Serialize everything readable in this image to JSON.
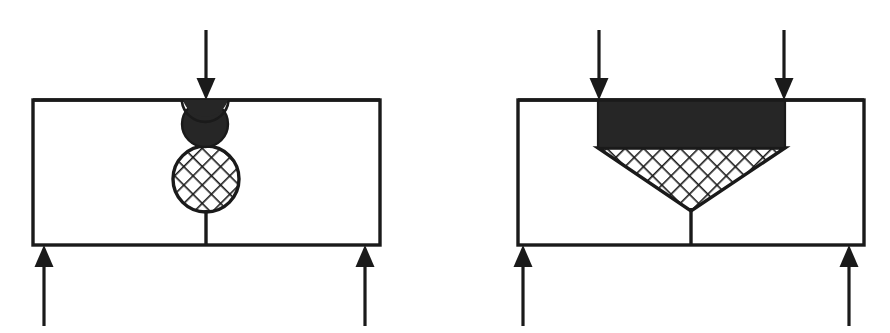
{
  "figure": {
    "background_color": "#ffffff",
    "stroke_color": "#1a1a1a",
    "fill_dark": "#262626",
    "fill_hatch_background": "#ffffff",
    "width": 890,
    "height": 333,
    "panels": [
      {
        "id": "left-panel",
        "name": "single-point-load-panel",
        "description": "Rectangular body with a single concentrated downward load, a solid dark circular contact zone and a cross-hatched circular plastic zone below it, supported by two upward reactions.",
        "body": {
          "name": "specimen-body",
          "shape": "rectangle",
          "x": 33,
          "y": 100,
          "width": 347,
          "height": 145,
          "stroke_width": 3,
          "fill": "#ffffff"
        },
        "load_arrows": [
          {
            "name": "applied-load-arrow",
            "direction": "down",
            "x": 206,
            "tail_y": 30,
            "tip_y": 100
          }
        ],
        "support_arrows": [
          {
            "name": "left-support-reaction-arrow",
            "direction": "up",
            "x": 44,
            "tail_y": 326,
            "tip_y": 245
          },
          {
            "name": "right-support-reaction-arrow",
            "direction": "up",
            "x": 365,
            "tail_y": 326,
            "tip_y": 245
          }
        ],
        "zones": [
          {
            "name": "dark-contact-circle",
            "shape": "circle",
            "fill_style": "solid-dark",
            "cx": 205,
            "cy": 124,
            "r": 23
          },
          {
            "name": "hatched-plastic-circle",
            "shape": "circle",
            "fill_style": "cross-hatch",
            "cx": 206,
            "cy": 179,
            "r": 33
          }
        ],
        "center_line": {
          "name": "symmetry-center-line",
          "x": 206,
          "y1": 211,
          "y2": 245,
          "stroke_width": 3
        }
      },
      {
        "id": "right-panel",
        "name": "distributed-load-panel",
        "description": "Rectangular body with two concentrated downward loads, a solid dark rectangular contact band and a cross-hatched wedge narrowing to a point, supported by two upward reactions.",
        "body": {
          "name": "specimen-body",
          "shape": "rectangle",
          "x": 518,
          "y": 100,
          "width": 346,
          "height": 145,
          "stroke_width": 3,
          "fill": "#ffffff"
        },
        "load_arrows": [
          {
            "name": "left-applied-load-arrow",
            "direction": "down",
            "x": 599,
            "tail_y": 30,
            "tip_y": 100
          },
          {
            "name": "right-applied-load-arrow",
            "direction": "down",
            "x": 784,
            "tail_y": 30,
            "tip_y": 100
          }
        ],
        "support_arrows": [
          {
            "name": "left-support-reaction-arrow",
            "direction": "up",
            "x": 523,
            "tail_y": 326,
            "tip_y": 245
          },
          {
            "name": "right-support-reaction-arrow",
            "direction": "up",
            "x": 849,
            "tail_y": 326,
            "tip_y": 245
          }
        ],
        "zones": [
          {
            "name": "dark-contact-band",
            "shape": "rectangle",
            "fill_style": "solid-dark",
            "x": 598,
            "y": 100,
            "width": 187,
            "height": 48
          },
          {
            "name": "hatched-wedge",
            "shape": "triangle-wedge",
            "fill_style": "cross-hatch",
            "points": "598,148 785,148 691,211",
            "apex_x": 691,
            "apex_y": 211
          }
        ],
        "center_line": {
          "name": "symmetry-center-line",
          "x": 691,
          "y1": 211,
          "y2": 245,
          "stroke_width": 3
        }
      }
    ],
    "arrow_head": {
      "name": "arrow-head",
      "half_width": 9,
      "length": 22
    },
    "hatch": {
      "name": "cross-hatch-pattern",
      "spacing": 13,
      "angle_degrees": 45,
      "line_width": 3
    }
  }
}
